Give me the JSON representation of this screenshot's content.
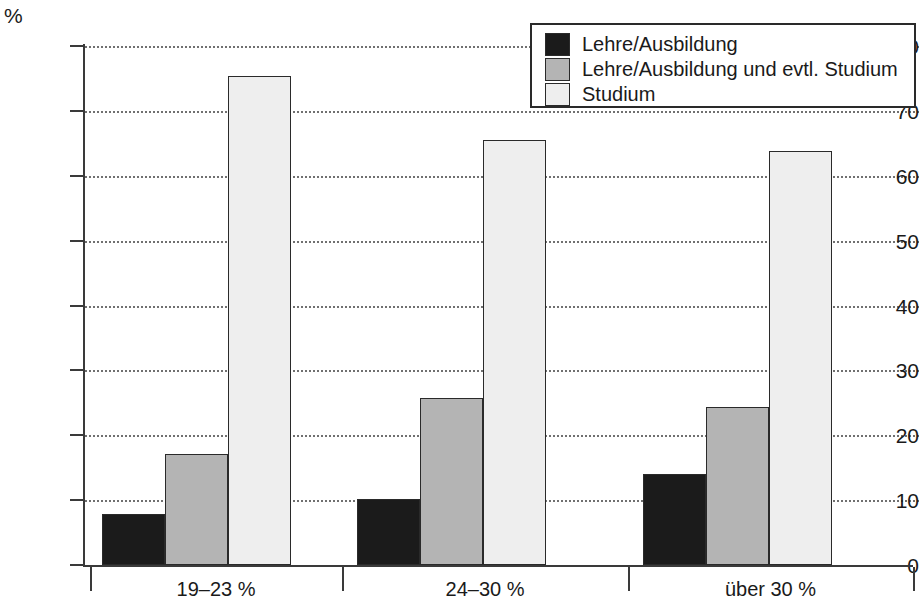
{
  "chart_data": {
    "type": "bar",
    "title": "",
    "xlabel": "",
    "ylabel": "%",
    "ylim": [
      0,
      80
    ],
    "yticks": [
      0,
      10,
      20,
      30,
      40,
      50,
      60,
      70,
      80
    ],
    "grid": true,
    "legend_position": "top-right",
    "categories": [
      "19–23 %",
      "24–30 %",
      "über 30 %"
    ],
    "series": [
      {
        "name": "Lehre/Ausbildung",
        "color": "#1b1b1b",
        "values": [
          7.8,
          10.2,
          14.1
        ]
      },
      {
        "name": "Lehre/Ausbildung und evtl. Studium",
        "color": "#b4b4b4",
        "values": [
          17.1,
          25.8,
          24.4
        ]
      },
      {
        "name": "Studium",
        "color": "#eeeeee",
        "values": [
          75.3,
          65.5,
          63.8
        ]
      }
    ]
  },
  "axis": {
    "unit": "%",
    "tick_labels": [
      "80",
      "70",
      "60",
      "50",
      "40",
      "30",
      "20",
      "10",
      "0"
    ]
  },
  "legend": {
    "entries": [
      {
        "label": "Lehre/Ausbildung"
      },
      {
        "label": "Lehre/Ausbildung und evtl. Studium"
      },
      {
        "label": "Studium"
      }
    ]
  },
  "x_labels": [
    "19–23 %",
    "24–30 %",
    "über 30 %"
  ]
}
